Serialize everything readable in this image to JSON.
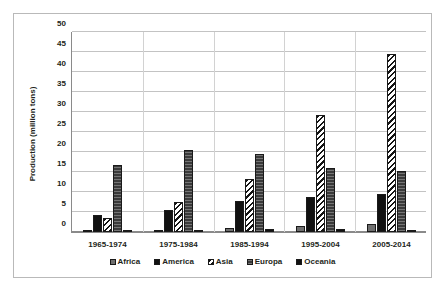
{
  "chart_data": {
    "type": "bar",
    "title": "",
    "xlabel": "",
    "ylabel": "Production (million tons)",
    "ylim": [
      0,
      50
    ],
    "ytick_step": 5,
    "yticks": [
      50,
      45,
      40,
      35,
      30,
      25,
      20,
      15,
      10,
      5,
      0
    ],
    "grid": true,
    "legend_position": "bottom",
    "categories": [
      "1965-1974",
      "1975-1984",
      "1985-1994",
      "1995-2004",
      "2005-2014"
    ],
    "series": [
      {
        "name": "Africa",
        "values": [
          0.3,
          0.4,
          0.9,
          1.4,
          2.1
        ],
        "fill": "solid-gray",
        "color": "#6f6f6f"
      },
      {
        "name": "America",
        "values": [
          4.2,
          5.6,
          7.7,
          8.8,
          9.4
        ],
        "fill": "solid-black",
        "color": "#111111"
      },
      {
        "name": "Asia",
        "values": [
          3.6,
          7.4,
          13.3,
          29.2,
          44.3
        ],
        "fill": "diagonal-hatch",
        "color": "#141414"
      },
      {
        "name": "Europa",
        "values": [
          16.6,
          20.5,
          19.3,
          15.8,
          15.3
        ],
        "fill": "dark-gray-texture",
        "color": "#3a3a3a"
      },
      {
        "name": "Oceania",
        "values": [
          0.6,
          0.4,
          0.7,
          0.8,
          0.6
        ],
        "fill": "solid-black",
        "color": "#111111"
      }
    ]
  },
  "style": {
    "background": "#ffffff",
    "border_color": "#b9b9b9",
    "axis_color": "#8a8a8a",
    "grid_color": "#c3c3c3",
    "text_color": "#231f20"
  }
}
